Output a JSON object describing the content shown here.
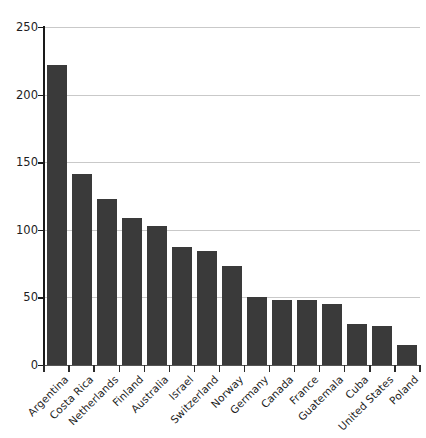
{
  "chart_data": {
    "type": "bar",
    "title": "",
    "subtitle": "",
    "xlabel": "",
    "ylabel": "",
    "ylim": [
      0,
      250
    ],
    "yticks": [
      0,
      50,
      100,
      150,
      200,
      250
    ],
    "grid": "horizontal",
    "legend": "none",
    "bar_color": "#3a3a3a",
    "gridline_color": "#c9c9c9",
    "axis_color": "#1a1a1a",
    "categories": [
      "Argentina",
      "Costa Rica",
      "Netherlands",
      "Finland",
      "Australia",
      "Israel",
      "Switzerland",
      "Norway",
      "Germany",
      "Canada",
      "France",
      "Guatemala",
      "Cuba",
      "United States",
      "Poland"
    ],
    "values": [
      222,
      141,
      123,
      109,
      103,
      87,
      84,
      73,
      50,
      48,
      48,
      45,
      30,
      29,
      15
    ]
  }
}
